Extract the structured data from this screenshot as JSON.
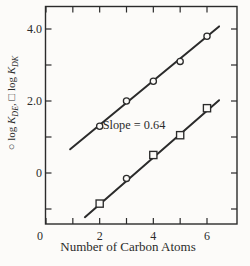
{
  "chart_data": {
    "type": "scatter",
    "title": "",
    "xlabel": "Number of Carbon Atoms",
    "ylabel_text": "○ log K_DE, □ log K_DK",
    "ylabel_segments": [
      {
        "t": "○ log ",
        "style": "normal"
      },
      {
        "t": "K",
        "style": "italic"
      },
      {
        "t": "DE",
        "style": "sub"
      },
      {
        "t": ", □ log ",
        "style": "normal"
      },
      {
        "t": "K",
        "style": "italic"
      },
      {
        "t": "DK",
        "style": "sub"
      }
    ],
    "annotation": "Slope = 0.64",
    "slope_value": 0.64,
    "xlim": [
      0,
      7.12
    ],
    "ylim": [
      -1.42,
      4.64
    ],
    "x_ticks": [
      0,
      1,
      2,
      3,
      4,
      5,
      6
    ],
    "x_tick_labels": [
      {
        "v": 0,
        "t": "0"
      },
      {
        "v": 2,
        "t": "2"
      },
      {
        "v": 4,
        "t": "4"
      },
      {
        "v": 6,
        "t": "6"
      }
    ],
    "y_ticks": [
      -1,
      0,
      1,
      2,
      3,
      4
    ],
    "y_tick_labels": [
      {
        "v": 4,
        "t": "4.0"
      },
      {
        "v": 2,
        "t": "2.0"
      },
      {
        "v": 0,
        "t": "0"
      }
    ],
    "grid": false,
    "legend": "none",
    "series": [
      {
        "name": "log K_DE",
        "marker": "circle",
        "x": [
          2,
          3,
          4,
          5,
          6
        ],
        "y": [
          1.3,
          2.0,
          2.55,
          3.1,
          3.8
        ],
        "markers": [
          "circle",
          "circle",
          "circle",
          "circle",
          "circle"
        ],
        "fit_line": {
          "x_start": 0.9,
          "x_end": 6.45,
          "slope": 0.615,
          "intercept": 0.105
        }
      },
      {
        "name": "log K_DK",
        "marker": "square",
        "x": [
          2,
          3,
          4,
          5,
          6
        ],
        "y": [
          -0.85,
          -0.15,
          0.5,
          1.05,
          1.8
        ],
        "markers": [
          "square",
          "circle",
          "square",
          "square",
          "square"
        ],
        "fit_line": {
          "x_start": 1.45,
          "x_end": 6.45,
          "slope": 0.65,
          "intercept": -2.17
        }
      }
    ],
    "colors": {
      "ink": "#2b2b2b",
      "background": "#fcfbf9",
      "marker_fill": "#fcfbf9"
    }
  }
}
